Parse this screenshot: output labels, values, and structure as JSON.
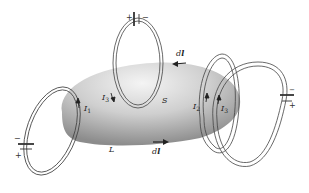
{
  "diagram": {
    "labels": {
      "surface": "S",
      "curve": "L",
      "dl_top": "d",
      "dl_top_bold": "l",
      "dl_bottom": "d",
      "dl_bottom_bold": "l",
      "i1": "I",
      "i1_sub": "1",
      "i2": "I",
      "i2_sub": "2",
      "i3_left": "I",
      "i3_left_sub": "3",
      "i3_right": "I",
      "i3_right_sub": "3"
    },
    "batteries": [
      {
        "id": "top",
        "plus": "+",
        "minus": "−"
      },
      {
        "id": "left",
        "plus": "+",
        "minus": "−"
      },
      {
        "id": "right",
        "plus": "+",
        "minus": "−"
      }
    ],
    "colors": {
      "surface_light": "#f2f2f2",
      "surface_dark": "#8a8a8a",
      "wire": "#444444",
      "background": "#ffffff"
    }
  }
}
